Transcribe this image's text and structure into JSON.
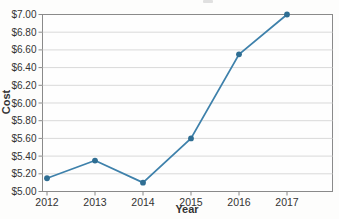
{
  "chart": {
    "xlabel": "Year",
    "ylabel": "Cost"
  },
  "chart_data": {
    "type": "line",
    "title": "",
    "categories": [
      "2012",
      "2013",
      "2014",
      "2015",
      "2016",
      "2017"
    ],
    "series": [
      {
        "name": "Cost",
        "values": [
          5.15,
          5.35,
          5.1,
          5.6,
          6.55,
          7.0
        ]
      }
    ],
    "xlabel": "Year",
    "ylabel": "Cost",
    "ylim": [
      5.0,
      7.0
    ],
    "ytick_step": 0.2,
    "ytick_labels": [
      "$5.00",
      "$5.20",
      "$5.40",
      "$5.60",
      "$5.80",
      "$6.00",
      "$6.20",
      "$6.40",
      "$6.60",
      "$6.80",
      "$7.00"
    ],
    "grid": true,
    "legend": "none",
    "colors": {
      "line": "#3e81ab",
      "marker": "#2f6e93",
      "gridline": "#d9d9d9",
      "axis": "#8a8a8a",
      "text": "#333333",
      "background": "#fdfdfc"
    }
  }
}
